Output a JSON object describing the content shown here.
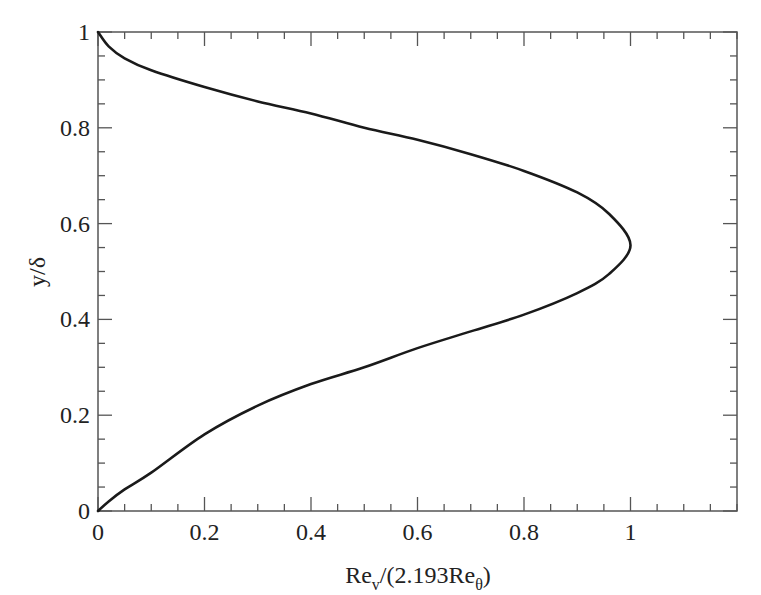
{
  "chart_data": {
    "type": "line",
    "title": "",
    "xlabel": "Re_v/(2.193Re_θ)",
    "xlabel_parts": {
      "main1": "Re",
      "sub1": "v",
      "main2": "/(2.193Re",
      "sub2": "θ",
      "main3": ")"
    },
    "ylabel": "y/δ",
    "xlim": [
      0,
      1.2
    ],
    "ylim": [
      0,
      1
    ],
    "x_ticks": [
      0,
      0.2,
      0.4,
      0.6,
      0.8,
      1
    ],
    "x_tick_labels": [
      "0",
      "0.2",
      "0.4",
      "0.6",
      "0.8",
      "1"
    ],
    "y_ticks": [
      0,
      0.2,
      0.4,
      0.6,
      0.8,
      1
    ],
    "y_tick_labels": [
      "0",
      "0.2",
      "0.4",
      "0.6",
      "0.8",
      "1"
    ],
    "x_minor_step": 0.05,
    "y_minor_step": 0.05,
    "grid": false,
    "legend": null,
    "series": [
      {
        "name": "Re_v profile",
        "color": "#1a1a1a",
        "points": [
          {
            "x": 0.0,
            "y": 0.0
          },
          {
            "x": 0.02,
            "y": 0.02
          },
          {
            "x": 0.05,
            "y": 0.045
          },
          {
            "x": 0.1,
            "y": 0.08
          },
          {
            "x": 0.2,
            "y": 0.16
          },
          {
            "x": 0.3,
            "y": 0.22
          },
          {
            "x": 0.4,
            "y": 0.265
          },
          {
            "x": 0.5,
            "y": 0.3
          },
          {
            "x": 0.6,
            "y": 0.34
          },
          {
            "x": 0.7,
            "y": 0.375
          },
          {
            "x": 0.8,
            "y": 0.41
          },
          {
            "x": 0.9,
            "y": 0.455
          },
          {
            "x": 0.96,
            "y": 0.495
          },
          {
            "x": 1.0,
            "y": 0.555
          },
          {
            "x": 0.96,
            "y": 0.62
          },
          {
            "x": 0.9,
            "y": 0.665
          },
          {
            "x": 0.8,
            "y": 0.71
          },
          {
            "x": 0.7,
            "y": 0.745
          },
          {
            "x": 0.6,
            "y": 0.775
          },
          {
            "x": 0.5,
            "y": 0.8
          },
          {
            "x": 0.4,
            "y": 0.83
          },
          {
            "x": 0.3,
            "y": 0.855
          },
          {
            "x": 0.2,
            "y": 0.885
          },
          {
            "x": 0.1,
            "y": 0.92
          },
          {
            "x": 0.05,
            "y": 0.945
          },
          {
            "x": 0.02,
            "y": 0.97
          },
          {
            "x": 0.0,
            "y": 1.0
          }
        ]
      }
    ],
    "peak": {
      "x": 1.0,
      "y": 0.555
    }
  }
}
